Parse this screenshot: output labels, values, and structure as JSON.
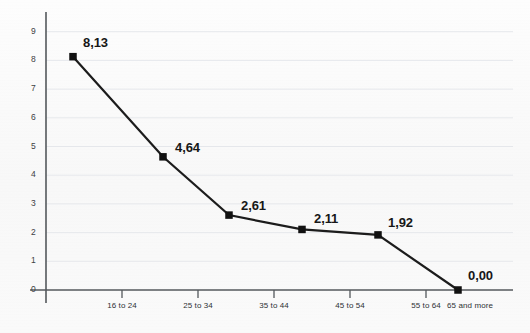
{
  "chart_data": {
    "type": "line",
    "title": "",
    "subtitle": "",
    "xlabel": "",
    "ylabel": "",
    "categories": [
      "16 to 24",
      "25 to 34",
      "35 to 44",
      "45 to 54",
      "55 to 64",
      "65 and more"
    ],
    "values": [
      8.13,
      4.64,
      2.61,
      2.11,
      1.92,
      0.0
    ],
    "data_labels": [
      "8,13",
      "4,64",
      "2,61",
      "2,11",
      "1,92",
      "0,00"
    ],
    "ylim": [
      0,
      9
    ],
    "yticks": [
      0,
      1,
      2,
      3,
      4,
      5,
      6,
      7,
      8,
      9
    ],
    "ytick_labels": [
      "0",
      "1",
      "2",
      "3",
      "4",
      "5",
      "6",
      "7",
      "8",
      "9"
    ],
    "grid": true,
    "grid_axis": "y",
    "legend": false,
    "legend_position": "none",
    "decimal_separator": ",",
    "marker": "square",
    "series": [
      {
        "name": "",
        "values": [
          8.13,
          4.64,
          2.61,
          2.11,
          1.92,
          0.0
        ]
      }
    ],
    "colors": {
      "line": "#1c1c1c",
      "marker": "#111111",
      "grid": "#e6e8ec",
      "axis": "#54585c",
      "background": "#fbfbfb",
      "label_text": "#171717",
      "tick_text": "#3d4043"
    }
  },
  "axes": {
    "y": {
      "ticks": [
        {
          "label": "9",
          "value": 9
        },
        {
          "label": "8",
          "value": 8
        },
        {
          "label": "7",
          "value": 7
        },
        {
          "label": "6",
          "value": 6
        },
        {
          "label": "5",
          "value": 5
        },
        {
          "label": "4",
          "value": 4
        },
        {
          "label": "3",
          "value": 3
        },
        {
          "label": "2",
          "value": 2
        },
        {
          "label": "1",
          "value": 1
        },
        {
          "label": "0",
          "value": 0
        }
      ]
    },
    "x": {
      "ticks": [
        {
          "label": "16 to 24"
        },
        {
          "label": "25 to 34"
        },
        {
          "label": "35 to 44"
        },
        {
          "label": "45 to 54"
        },
        {
          "label": "55 to 64"
        },
        {
          "label": "65 and more"
        }
      ]
    }
  },
  "points": [
    {
      "label": "8,13",
      "category": "16 to 24",
      "value": 8.13
    },
    {
      "label": "4,64",
      "category": "25 to 34",
      "value": 4.64
    },
    {
      "label": "2,61",
      "category": "35 to 44",
      "value": 2.61
    },
    {
      "label": "2,11",
      "category": "45 to 54",
      "value": 2.11
    },
    {
      "label": "1,92",
      "category": "55 to 64",
      "value": 1.92
    },
    {
      "label": "0,00",
      "category": "65 and more",
      "value": 0.0
    }
  ]
}
